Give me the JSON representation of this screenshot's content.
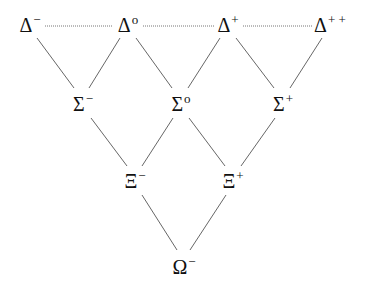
{
  "diagram": {
    "line_color": "#555555",
    "dotted_color": "#777777",
    "nodes": [
      {
        "id": "delta_minus",
        "symbol": "Δ",
        "charge": "−",
        "x": 30,
        "y": 24
      },
      {
        "id": "delta_zero",
        "symbol": "Δ",
        "charge": "o",
        "x": 128,
        "y": 24
      },
      {
        "id": "delta_plus",
        "symbol": "Δ",
        "charge": "+",
        "x": 228,
        "y": 24
      },
      {
        "id": "delta_plusplus",
        "symbol": "Δ",
        "charge": "+ +",
        "x": 330,
        "y": 24
      },
      {
        "id": "sigma_minus",
        "symbol": "Σ",
        "charge": "−",
        "x": 83,
        "y": 103
      },
      {
        "id": "sigma_zero",
        "symbol": "Σ",
        "charge": "o",
        "x": 181,
        "y": 103
      },
      {
        "id": "sigma_plus",
        "symbol": "Σ",
        "charge": "+",
        "x": 283,
        "y": 103
      },
      {
        "id": "xi_minus",
        "symbol": "Ξ",
        "charge": "−",
        "x": 135,
        "y": 180
      },
      {
        "id": "xi_plus",
        "symbol": "Ξ",
        "charge": "+",
        "x": 233,
        "y": 180
      },
      {
        "id": "omega_minus",
        "symbol": "Ω",
        "charge": "−",
        "x": 184,
        "y": 266
      }
    ],
    "dotted_edges": [
      {
        "x1": 45,
        "y1": 26,
        "x2": 113,
        "y2": 26
      },
      {
        "x1": 143,
        "y1": 26,
        "x2": 214,
        "y2": 26
      },
      {
        "x1": 243,
        "y1": 26,
        "x2": 313,
        "y2": 26
      }
    ],
    "edges": [
      {
        "x1": 37,
        "y1": 38,
        "x2": 74,
        "y2": 88
      },
      {
        "x1": 120,
        "y1": 38,
        "x2": 89,
        "y2": 88
      },
      {
        "x1": 136,
        "y1": 38,
        "x2": 172,
        "y2": 88
      },
      {
        "x1": 220,
        "y1": 38,
        "x2": 188,
        "y2": 88
      },
      {
        "x1": 236,
        "y1": 38,
        "x2": 274,
        "y2": 88
      },
      {
        "x1": 322,
        "y1": 38,
        "x2": 290,
        "y2": 88
      },
      {
        "x1": 91,
        "y1": 118,
        "x2": 127,
        "y2": 166
      },
      {
        "x1": 173,
        "y1": 118,
        "x2": 142,
        "y2": 166
      },
      {
        "x1": 189,
        "y1": 118,
        "x2": 225,
        "y2": 166
      },
      {
        "x1": 275,
        "y1": 118,
        "x2": 241,
        "y2": 166
      },
      {
        "x1": 142,
        "y1": 195,
        "x2": 177,
        "y2": 250
      },
      {
        "x1": 226,
        "y1": 195,
        "x2": 190,
        "y2": 250
      }
    ]
  }
}
